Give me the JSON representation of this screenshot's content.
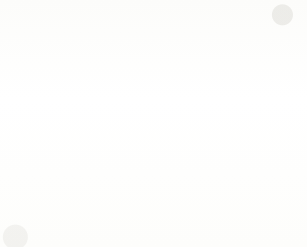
{
  "chart_data": {
    "type": "line",
    "title": "",
    "xlabel": "Third octave band centre frequency (Hz)",
    "ylabel": "Normalised SL difference Dn (dB)",
    "categories": [
      "100",
      "125",
      "160",
      "200",
      "250",
      "315",
      "400",
      "500",
      "630",
      "800",
      "1000",
      "1250",
      "1600",
      "2000",
      "2500",
      "3150"
    ],
    "ylim": [
      0,
      80
    ],
    "yticks": [
      "0",
      "10",
      "20",
      "30",
      "40",
      "50",
      "60",
      "70",
      "80"
    ],
    "grid": true,
    "legend": "none",
    "series": [
      {
        "name": "series-upper",
        "marker": "square",
        "values": [
          24.0,
          27.2,
          35.3,
          35.7,
          36.9,
          40.5,
          41.0,
          44.4,
          46.7,
          50.8,
          50.4,
          50.9,
          50.5,
          49.4,
          50.0,
          50.7
        ]
      },
      {
        "name": "series-lower",
        "marker": "diamond",
        "values": [
          20.0,
          27.2,
          31.2,
          35.4,
          35.2,
          38.2,
          41.0,
          42.0,
          41.4,
          38.6,
          40.7,
          42.6,
          42.8,
          45.5,
          47.8,
          48.2
        ]
      }
    ]
  },
  "axes": {
    "x_tick_labels": [
      "100",
      "125",
      "160",
      "200",
      "250",
      "315",
      "400",
      "500",
      "630",
      "800",
      "1000",
      "1250",
      "1600",
      "2000",
      "2500",
      "3150"
    ],
    "y_tick_labels": [
      "0",
      "10",
      "20",
      "30",
      "40",
      "50",
      "60",
      "70",
      "80"
    ],
    "x_axis_title": "Third octave band centre frequency (Hz)",
    "y_axis_title": "Normalised SL difference Dn (dB)"
  },
  "style": {
    "grid_color": "#c9ccd2",
    "axis_color": "#5a5a5a",
    "line_color": "#4a4a4a",
    "marker_color": "#2b2b2b",
    "background": "#ffffff"
  }
}
